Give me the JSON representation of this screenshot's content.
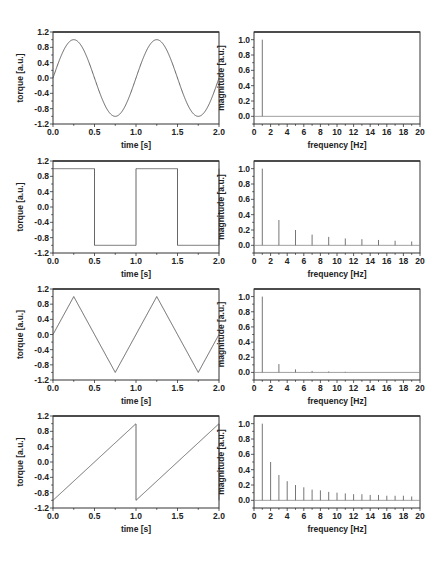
{
  "figure": {
    "width": 447,
    "height": 566,
    "colors": {
      "line": "#555555",
      "frame": "#333333",
      "text": "#222222",
      "background": "#ffffff"
    }
  },
  "chart_data": [
    {
      "id": "sine-time",
      "type": "line",
      "title": "",
      "xlabel": "time [s]",
      "ylabel": "torque [a.u.]",
      "xlim": [
        0.0,
        2.0
      ],
      "ylim": [
        -1.2,
        1.2
      ],
      "xticks": [
        "0.0",
        "0.5",
        "1.0",
        "1.5",
        "2.0"
      ],
      "yticks": [
        "1.2",
        "0.8",
        "0.4",
        "0.0",
        "-0.4",
        "-0.8",
        "-1.2"
      ],
      "waveform": "sine",
      "frequency_hz": 1,
      "amplitude": 1,
      "grid": false,
      "frame_px": {
        "x0": 53,
        "y0": 32,
        "x1": 219,
        "y1": 124
      }
    },
    {
      "id": "sine-spectrum",
      "type": "bar",
      "title": "",
      "xlabel": "frequency [Hz]",
      "ylabel": "magnitude [a.u.]",
      "xlim": [
        0,
        20
      ],
      "ylim": [
        -0.1,
        1.1
      ],
      "xticks": [
        "0",
        "2",
        "4",
        "6",
        "8",
        "10",
        "12",
        "14",
        "16",
        "18",
        "20"
      ],
      "yticks": [
        "1.0",
        "0.8",
        "0.6",
        "0.4",
        "0.2",
        "0.0"
      ],
      "x": [
        1
      ],
      "values": [
        1.0
      ],
      "grid": false,
      "frame_px": {
        "x0": 254,
        "y0": 32,
        "x1": 420,
        "y1": 124
      }
    },
    {
      "id": "square-time",
      "type": "line",
      "title": "",
      "xlabel": "time [s]",
      "ylabel": "torque [a.u.]",
      "xlim": [
        0.0,
        2.0
      ],
      "ylim": [
        -1.2,
        1.2
      ],
      "xticks": [
        "0.0",
        "0.5",
        "1.0",
        "1.5",
        "2.0"
      ],
      "yticks": [
        "1.2",
        "0.8",
        "0.4",
        "0.0",
        "-0.4",
        "-0.8",
        "-1.2"
      ],
      "waveform": "square",
      "frequency_hz": 1,
      "amplitude": 1,
      "grid": false,
      "frame_px": {
        "x0": 53,
        "y0": 161,
        "x1": 219,
        "y1": 253
      }
    },
    {
      "id": "square-spectrum",
      "type": "bar",
      "title": "",
      "xlabel": "frequency [Hz]",
      "ylabel": "magnitude [a.u.]",
      "xlim": [
        0,
        20
      ],
      "ylim": [
        -0.1,
        1.1
      ],
      "xticks": [
        "0",
        "2",
        "4",
        "6",
        "8",
        "10",
        "12",
        "14",
        "16",
        "18",
        "20"
      ],
      "yticks": [
        "1.0",
        "0.8",
        "0.6",
        "0.4",
        "0.2",
        "0.0"
      ],
      "x": [
        1,
        3,
        5,
        7,
        9,
        11,
        13,
        15,
        17,
        19
      ],
      "values": [
        1.0,
        0.33,
        0.2,
        0.14,
        0.11,
        0.09,
        0.08,
        0.07,
        0.06,
        0.05
      ],
      "grid": false,
      "frame_px": {
        "x0": 254,
        "y0": 161,
        "x1": 420,
        "y1": 253
      }
    },
    {
      "id": "triangle-time",
      "type": "line",
      "title": "",
      "xlabel": "time [s]",
      "ylabel": "torque [a.u.]",
      "xlim": [
        0.0,
        2.0
      ],
      "ylim": [
        -1.2,
        1.2
      ],
      "xticks": [
        "0.0",
        "0.5",
        "1.0",
        "1.5",
        "2.0"
      ],
      "yticks": [
        "1.2",
        "0.8",
        "0.4",
        "0.0",
        "-0.4",
        "-0.8",
        "-1.2"
      ],
      "waveform": "triangle",
      "frequency_hz": 1,
      "amplitude": 1,
      "grid": false,
      "frame_px": {
        "x0": 53,
        "y0": 289,
        "x1": 219,
        "y1": 380
      }
    },
    {
      "id": "triangle-spectrum",
      "type": "bar",
      "title": "",
      "xlabel": "frequency [Hz]",
      "ylabel": "magnitude [a.u.]",
      "xlim": [
        0,
        20
      ],
      "ylim": [
        -0.1,
        1.1
      ],
      "xticks": [
        "0",
        "2",
        "4",
        "6",
        "8",
        "10",
        "12",
        "14",
        "16",
        "18",
        "20"
      ],
      "yticks": [
        "1.0",
        "0.8",
        "0.6",
        "0.4",
        "0.2",
        "0.0"
      ],
      "x": [
        1,
        3,
        5,
        7,
        9,
        11
      ],
      "values": [
        1.0,
        0.11,
        0.04,
        0.02,
        0.012,
        0.008
      ],
      "grid": false,
      "frame_px": {
        "x0": 254,
        "y0": 289,
        "x1": 420,
        "y1": 380
      }
    },
    {
      "id": "sawtooth-time",
      "type": "line",
      "title": "",
      "xlabel": "time [s]",
      "ylabel": "torque [a.u.]",
      "xlim": [
        0.0,
        2.0
      ],
      "ylim": [
        -1.2,
        1.2
      ],
      "xticks": [
        "0.0",
        "0.5",
        "1.0",
        "1.5",
        "2.0"
      ],
      "yticks": [
        "1.2",
        "0.8",
        "0.4",
        "0.0",
        "-0.4",
        "-0.8",
        "-1.2"
      ],
      "waveform": "sawtooth",
      "frequency_hz": 1,
      "amplitude": 1,
      "grid": false,
      "frame_px": {
        "x0": 53,
        "y0": 416,
        "x1": 219,
        "y1": 508
      }
    },
    {
      "id": "sawtooth-spectrum",
      "type": "bar",
      "title": "",
      "xlabel": "frequency [Hz]",
      "ylabel": "magnitude [a.u.]",
      "xlim": [
        0,
        20
      ],
      "ylim": [
        -0.1,
        1.1
      ],
      "xticks": [
        "0",
        "2",
        "4",
        "6",
        "8",
        "10",
        "12",
        "14",
        "16",
        "18",
        "20"
      ],
      "yticks": [
        "1.0",
        "0.8",
        "0.6",
        "0.4",
        "0.2",
        "0.0"
      ],
      "x": [
        1,
        2,
        3,
        4,
        5,
        6,
        7,
        8,
        9,
        10,
        11,
        12,
        13,
        14,
        15,
        16,
        17,
        18,
        19
      ],
      "values": [
        1.0,
        0.5,
        0.33,
        0.25,
        0.2,
        0.17,
        0.14,
        0.13,
        0.11,
        0.1,
        0.09,
        0.08,
        0.08,
        0.07,
        0.07,
        0.06,
        0.06,
        0.06,
        0.05
      ],
      "grid": false,
      "frame_px": {
        "x0": 254,
        "y0": 416,
        "x1": 420,
        "y1": 508
      }
    }
  ]
}
